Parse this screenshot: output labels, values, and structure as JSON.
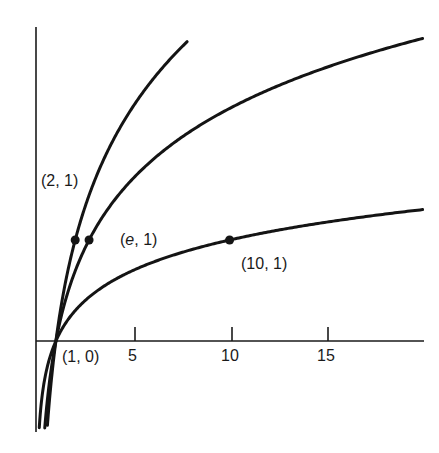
{
  "chart_data": {
    "type": "line",
    "title": "",
    "xlabel": "",
    "ylabel": "",
    "xlim": [
      0,
      20
    ],
    "ylim": [
      -0.9,
      3.1
    ],
    "grid": false,
    "legend": null,
    "x_ticks": [
      5,
      10,
      15
    ],
    "x_tick_labels": [
      "5",
      "10",
      "15"
    ],
    "series": [
      {
        "name": "log_2 x",
        "base": 2,
        "x_range": [
          0.05,
          7.8
        ]
      },
      {
        "name": "ln x",
        "base": 2.718281828,
        "x_range": [
          0.05,
          20
        ]
      },
      {
        "name": "log_10 x",
        "base": 10,
        "x_range": [
          0.05,
          20
        ]
      }
    ],
    "points": [
      {
        "x": 2,
        "y": 1,
        "label": "(2, 1)"
      },
      {
        "x": 2.718,
        "y": 1,
        "label_prefix": "(",
        "label_italic": "e",
        "label_suffix": ", 1)"
      },
      {
        "x": 10,
        "y": 1,
        "label": "(10, 1)"
      },
      {
        "x": 1,
        "y": 0,
        "label": "(1, 0)"
      }
    ]
  },
  "labels": {
    "p21": "(2, 1)",
    "pe1_open": "(",
    "pe1_e": "e",
    "pe1_close": ", 1)",
    "p101": "(10, 1)",
    "p10": "(1, 0)",
    "t5": "5",
    "t10": "10",
    "t15": "15"
  },
  "colors": {
    "ink": "#141414",
    "background": "#ffffff"
  }
}
